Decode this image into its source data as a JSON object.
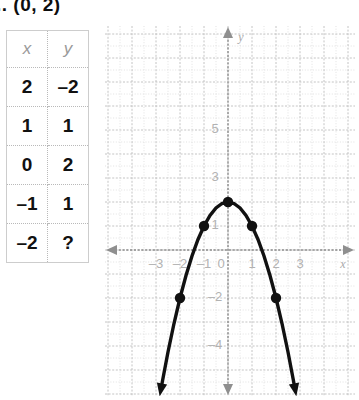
{
  "header": {
    "answer_text": ".. (0, 2)"
  },
  "table": {
    "columns": [
      "x",
      "y"
    ],
    "rows": [
      {
        "x": "2",
        "y": "–2"
      },
      {
        "x": "1",
        "y": "1"
      },
      {
        "x": "0",
        "y": "2"
      },
      {
        "x": "–1",
        "y": "1"
      },
      {
        "x": "–2",
        "y": "?"
      }
    ]
  },
  "graph": {
    "x_axis_name": "x",
    "y_axis_name": "y",
    "x_tick_labels": [
      "–3",
      "–2",
      "–1",
      "0",
      "1",
      "2",
      "3"
    ],
    "y_tick_labels": [
      "5",
      "3",
      "1",
      "–2",
      "–4"
    ],
    "colors": {
      "curve": "#111111",
      "point": "#111111",
      "grid_minor": "#d6d6d6",
      "grid_major": "#bdbdbd",
      "axis": "#8f8f8f",
      "tick_text": "#b2b2b2"
    }
  },
  "chart_data": {
    "type": "line",
    "title": "",
    "xlabel": "x",
    "ylabel": "y",
    "xlim": [
      -4,
      4
    ],
    "ylim": [
      -5,
      6
    ],
    "grid": true,
    "legend": "none",
    "equation": "y = 2 - x^2",
    "xticks": [
      -3,
      -2,
      -1,
      0,
      1,
      2,
      3
    ],
    "yticks": [
      5,
      3,
      1,
      -2,
      -4
    ],
    "series": [
      {
        "name": "y = 2 - x^2",
        "marked_points": [
          {
            "x": -2,
            "y": -2
          },
          {
            "x": -1,
            "y": 1
          },
          {
            "x": 0,
            "y": 2
          },
          {
            "x": 1,
            "y": 1
          },
          {
            "x": 2,
            "y": -2
          }
        ],
        "x": [
          -2.75,
          -2.5,
          -2.25,
          -2,
          -1.75,
          -1.5,
          -1.25,
          -1,
          -0.75,
          -0.5,
          -0.25,
          0,
          0.25,
          0.5,
          0.75,
          1,
          1.25,
          1.5,
          1.75,
          2,
          2.25,
          2.5,
          2.75
        ],
        "values": [
          -5.5625,
          -4.25,
          -3.0625,
          -2,
          -1.0625,
          -0.25,
          0.4375,
          1,
          1.4375,
          1.75,
          1.9375,
          2,
          1.9375,
          1.75,
          1.4375,
          1,
          0.4375,
          -0.25,
          -1.0625,
          -2,
          -3.0625,
          -4.25,
          -5.5625
        ]
      }
    ]
  }
}
